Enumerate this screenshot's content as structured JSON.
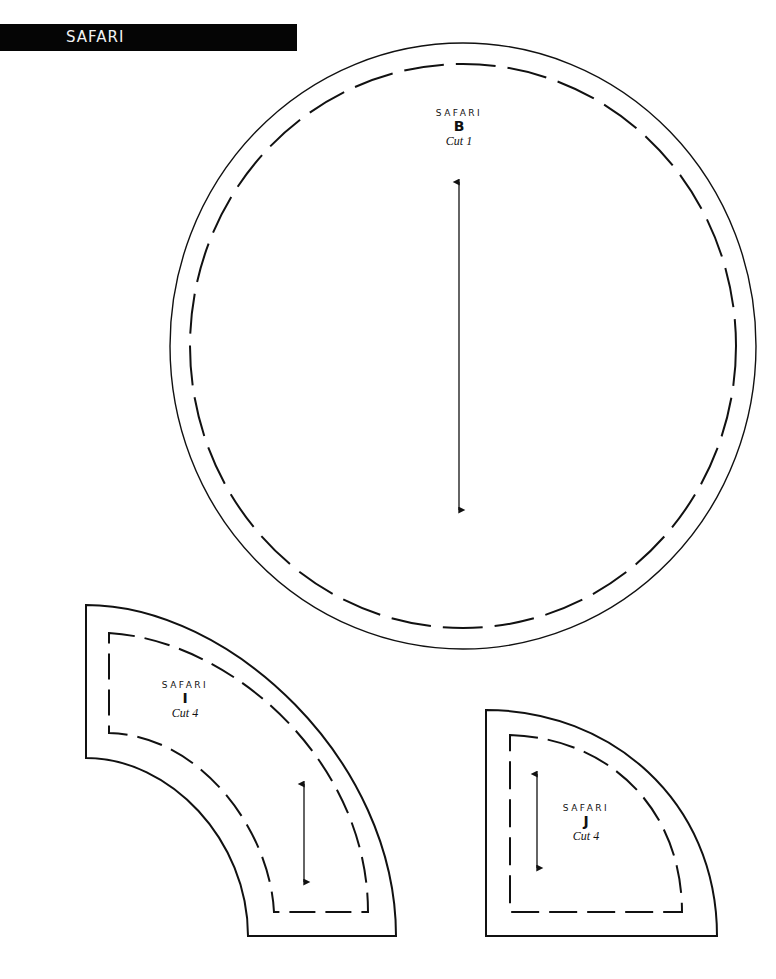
{
  "header": {
    "title": "SAFARI",
    "bar_color": "#050505",
    "text_color": "#f2f2f2"
  },
  "pieces": [
    {
      "id": "B",
      "brand": "SAFARI",
      "letter": "B",
      "cut_label": "Cut 1",
      "shape": "circle"
    },
    {
      "id": "I",
      "brand": "SAFARI",
      "letter": "I",
      "cut_label": "Cut 4",
      "shape": "arc-band"
    },
    {
      "id": "J",
      "brand": "SAFARI",
      "letter": "J",
      "cut_label": "Cut 4",
      "shape": "quarter-circle"
    }
  ],
  "line_color": "#111111"
}
